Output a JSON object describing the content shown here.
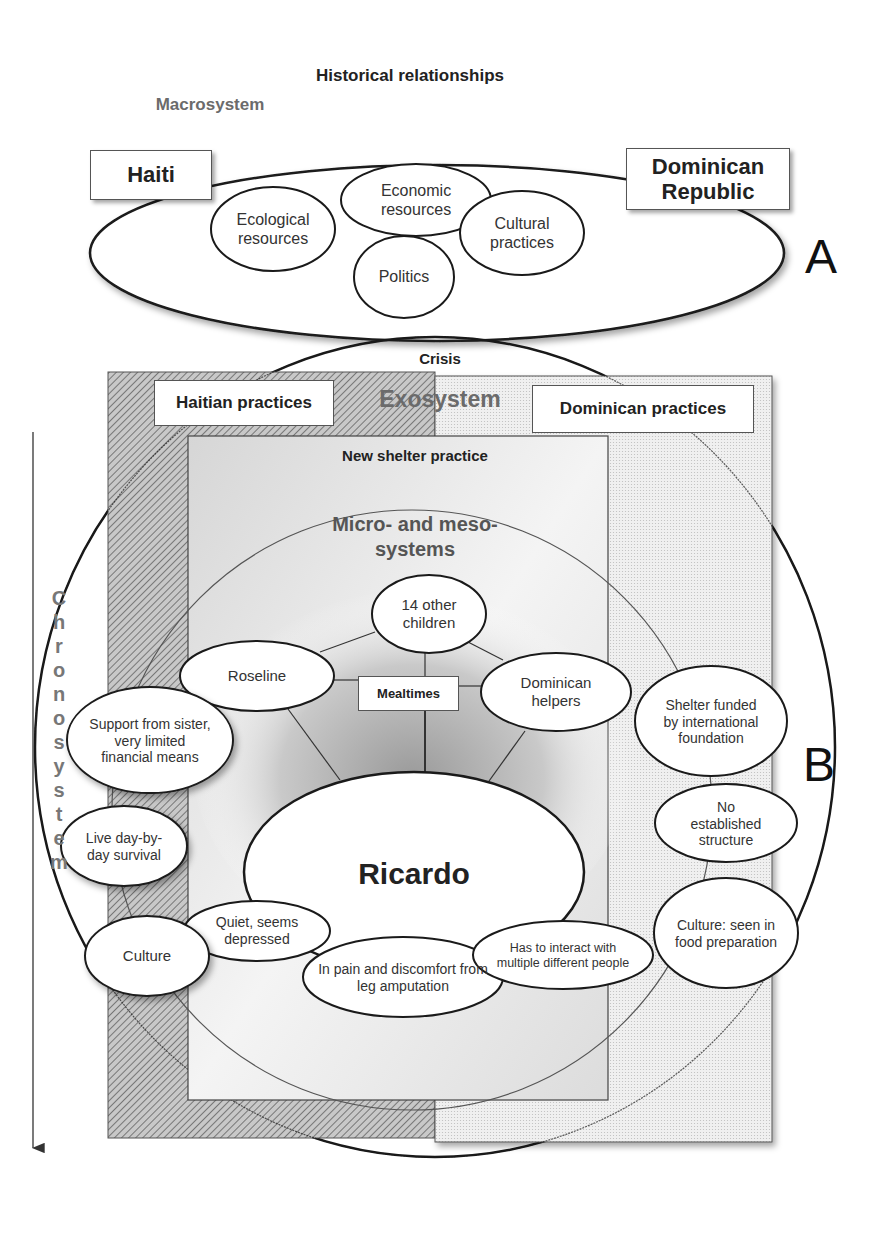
{
  "header": {
    "title": "Historical relationships",
    "macrosystem_label": "Macrosystem"
  },
  "panel_a": {
    "letter": "A",
    "country_left": "Haiti",
    "country_right": "Dominican Republic",
    "factors": [
      {
        "id": "ecological",
        "text": "Ecological resources"
      },
      {
        "id": "economic",
        "text": "Economic resources"
      },
      {
        "id": "cultural",
        "text": "Cultural practices"
      },
      {
        "id": "politics",
        "text": "Politics"
      }
    ]
  },
  "panel_b": {
    "letter": "B",
    "crisis_label": "Crisis",
    "exosystem_label": "Exosystem",
    "haitian_practices": "Haitian practices",
    "dominican_practices": "Dominican practices",
    "new_shelter_practice": "New shelter practice",
    "micro_meso_label": "Micro- and meso-systems",
    "chronosystem_letters": [
      "C",
      "h",
      "r",
      "o",
      "n",
      "o",
      "s",
      "y",
      "s",
      "t",
      "e",
      "m"
    ],
    "center": "Ricardo",
    "hub": "Mealtimes",
    "microsystem_nodes": [
      {
        "id": "other-children",
        "text": "14 other children"
      },
      {
        "id": "roseline",
        "text": "Roseline"
      },
      {
        "id": "dominican-helpers",
        "text": "Dominican helpers"
      }
    ],
    "ricardo_traits": [
      {
        "id": "quiet",
        "text": "Quiet, seems depressed"
      },
      {
        "id": "pain",
        "text": "In pain and discomfort from leg amputation"
      },
      {
        "id": "interact",
        "text": "Has to interact with multiple different people"
      }
    ],
    "haitian_side": [
      {
        "id": "support",
        "text": "Support from sister, very limited financial means"
      },
      {
        "id": "survival",
        "text": "Live day-by-day survival"
      },
      {
        "id": "culture-haiti",
        "text": "Culture"
      }
    ],
    "dominican_side": [
      {
        "id": "shelter-funded",
        "text": "Shelter funded by international foundation"
      },
      {
        "id": "no-structure",
        "text": "No established structure"
      },
      {
        "id": "culture-dr",
        "text": "Culture: seen in food preparation"
      }
    ]
  },
  "colors": {
    "stroke": "#1a1a1a",
    "exosystem_text": "#6b6b6b",
    "macrosystem_text": "#6b6b6b",
    "chronosystem_text": "#777777",
    "hatch_dark": "#8a8a8a",
    "dots_light": "#d0d0d0"
  }
}
